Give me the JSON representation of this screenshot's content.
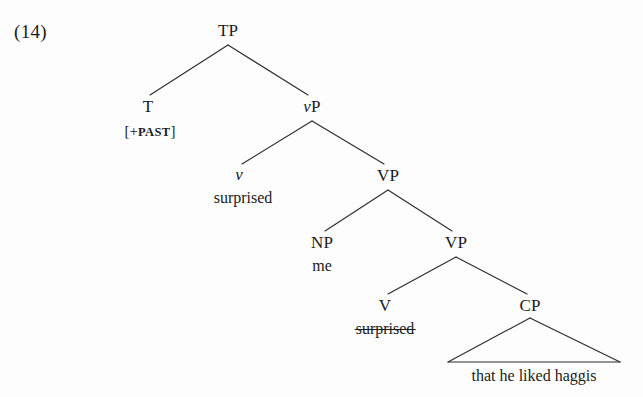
{
  "example": {
    "number": "(14)"
  },
  "tree": {
    "nodes": {
      "tp": "TP",
      "t": "T",
      "vp_small": "vP",
      "v_small": "v",
      "vp_upper": "VP",
      "np": "NP",
      "vp_lower": "VP",
      "v_big": "V",
      "cp": "CP"
    },
    "node_parts": {
      "vp_small_italic": "v",
      "vp_small_rest": "P"
    },
    "terminals": {
      "t_features_open": "[+",
      "t_features_label": "PAST",
      "t_features_close": "]",
      "v_small_word": "surprised",
      "np_word": "me",
      "v_big_word": "surprised",
      "cp_phrase": "that he liked haggis"
    },
    "annotations": {
      "v_big_word_struck": true
    },
    "colors": {
      "line": "#2a2a2a",
      "text": "#1b1b1b",
      "background": "#fdfdfd"
    },
    "geometry": {
      "tp": [
        228,
        30
      ],
      "t": [
        148,
        106
      ],
      "vp_small": [
        312,
        106
      ],
      "v_small": [
        239,
        175
      ],
      "vp_upper": [
        388,
        175
      ],
      "np": [
        322,
        242
      ],
      "vp_lower": [
        456,
        242
      ],
      "v_big": [
        385,
        305
      ],
      "cp": [
        530,
        305
      ],
      "cp_triangle_left": [
        448,
        362
      ],
      "cp_triangle_right": [
        620,
        362
      ]
    }
  }
}
